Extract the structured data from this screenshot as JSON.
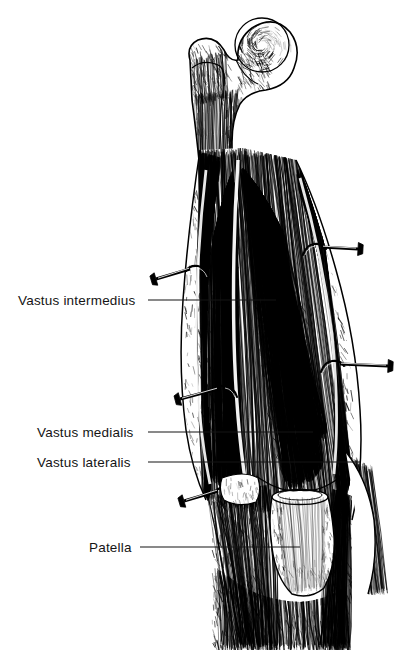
{
  "figure": {
    "medium": "pen-and-ink line engraving",
    "background_color": "#ffffff",
    "ink_color": "#000000",
    "width": 407,
    "height": 658
  },
  "labels": [
    {
      "id": "vastus-intermedius",
      "text": "Vastus intermedius",
      "text_x": 18,
      "text_y": 305,
      "leader_x1": 148,
      "leader_y1": 300,
      "leader_x2": 276,
      "leader_y2": 300
    },
    {
      "id": "vastus-medialis",
      "text": "Vastus medialis",
      "text_x": 37,
      "text_y": 437,
      "leader_x1": 148,
      "leader_y1": 432,
      "leader_x2": 313,
      "leader_y2": 432
    },
    {
      "id": "vastus-lateralis",
      "text": "Vastus lateralis",
      "text_x": 37,
      "text_y": 467,
      "leader_x1": 148,
      "leader_y1": 462,
      "leader_x2": 360,
      "leader_y2": 462
    },
    {
      "id": "patella",
      "text": "Patella",
      "text_x": 89,
      "text_y": 552,
      "leader_x1": 140,
      "leader_y1": 547,
      "leader_x2": 300,
      "leader_y2": 547
    }
  ],
  "structures": [
    {
      "id": "femoral-head",
      "name": "Femoral head",
      "cx": 262,
      "cy": 45,
      "r": 28
    },
    {
      "id": "greater-trochanter",
      "name": "Greater trochanter",
      "cx": 198,
      "cy": 78,
      "r": 18
    },
    {
      "id": "femoral-neck",
      "name": "Femoral neck"
    },
    {
      "id": "quadriceps-mass",
      "name": "Quadriceps femoris muscle mass"
    },
    {
      "id": "patella-bone",
      "name": "Patella",
      "cx": 300,
      "cy": 530
    },
    {
      "id": "patellar-tendon",
      "name": "Patellar tendon"
    },
    {
      "id": "tibia-shaft",
      "name": "Leg below knee"
    }
  ],
  "retractor_hooks": [
    {
      "id": "hook-upper-right",
      "x": 312,
      "y": 243,
      "dir": "right",
      "length": 46
    },
    {
      "id": "hook-upper-left",
      "x": 200,
      "y": 265,
      "dir": "left",
      "length": 44
    },
    {
      "id": "hook-mid-right",
      "x": 330,
      "y": 360,
      "dir": "right",
      "length": 58
    },
    {
      "id": "hook-mid-left",
      "x": 228,
      "y": 385,
      "dir": "left",
      "length": 48
    },
    {
      "id": "hook-lower-left",
      "x": 228,
      "y": 487,
      "dir": "left",
      "length": 44
    }
  ]
}
